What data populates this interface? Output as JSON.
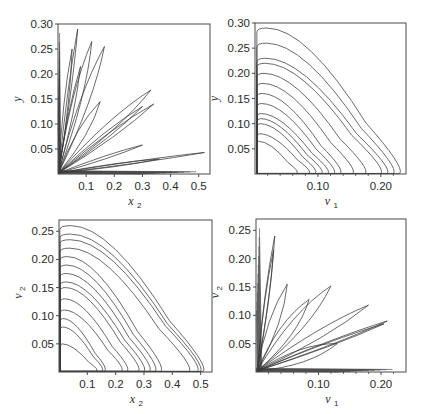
{
  "chart_data": [
    {
      "type": "line",
      "panel": "top-left",
      "title": "",
      "xlabel": "x2",
      "xlabel_main": "x",
      "xlabel_sub": "2",
      "ylabel": "y",
      "ylabel_main": "y",
      "ylabel_sub": "",
      "xlim": [
        0,
        0.54
      ],
      "ylim": [
        0,
        0.3
      ],
      "xticks": [
        0.1,
        0.2,
        0.3,
        0.4,
        0.5
      ],
      "xtick_labels": [
        "0.1",
        "0.2",
        "0.3",
        "0.4",
        "0.5"
      ],
      "yticks": [
        0.05,
        0.1,
        0.15,
        0.2,
        0.25,
        0.3
      ],
      "ytick_labels": [
        "0.05",
        "0.10",
        "0.15",
        "0.20",
        "0.25",
        "0.30"
      ],
      "grid": false,
      "description": "Phase-plane trajectory: many elongated loops radiating from the origin at varying angles",
      "loops": [
        {
          "tip_x": 0.07,
          "tip_y": 0.29,
          "width": 0.01
        },
        {
          "tip_x": 0.12,
          "tip_y": 0.265,
          "width": 0.03
        },
        {
          "tip_x": 0.165,
          "tip_y": 0.255,
          "width": 0.03
        },
        {
          "tip_x": 0.05,
          "tip_y": 0.25,
          "width": 0.015
        },
        {
          "tip_x": 0.08,
          "tip_y": 0.215,
          "width": 0.015
        },
        {
          "tip_x": 0.15,
          "tip_y": 0.145,
          "width": 0.03
        },
        {
          "tip_x": 0.33,
          "tip_y": 0.168,
          "width": 0.03
        },
        {
          "tip_x": 0.34,
          "tip_y": 0.14,
          "width": 0.02
        },
        {
          "tip_x": 0.3,
          "tip_y": 0.135,
          "width": 0.02
        },
        {
          "tip_x": 0.3,
          "tip_y": 0.058,
          "width": 0.01
        },
        {
          "tip_x": 0.52,
          "tip_y": 0.043,
          "width": 0.005
        },
        {
          "tip_x": 0.36,
          "tip_y": 0.03,
          "width": 0.01
        }
      ]
    },
    {
      "type": "line",
      "panel": "top-right",
      "title": "",
      "xlabel": "v1",
      "xlabel_main": "v",
      "xlabel_sub": "1",
      "ylabel": "y",
      "ylabel_main": "y",
      "ylabel_sub": "",
      "xlim": [
        0,
        0.24
      ],
      "ylim": [
        0,
        0.3
      ],
      "xticks": [
        0.1,
        0.2
      ],
      "xtick_labels": [
        "0.10",
        "0.20"
      ],
      "minor_xticks": [
        0.02,
        0.04,
        0.06,
        0.08,
        0.12,
        0.14,
        0.16,
        0.18,
        0.22
      ],
      "yticks": [
        0.05,
        0.1,
        0.15,
        0.2,
        0.25,
        0.3
      ],
      "ytick_labels": [
        "0.05",
        "0.10",
        "0.15",
        "0.20",
        "0.25",
        "0.30"
      ],
      "grid": false,
      "description": "Nested skewed-triangular orbits starting near v1=0",
      "orbits": [
        {
          "peak_y": 0.29,
          "max_x": 0.235
        },
        {
          "peak_y": 0.26,
          "max_x": 0.225
        },
        {
          "peak_y": 0.23,
          "max_x": 0.215
        },
        {
          "peak_y": 0.22,
          "max_x": 0.205
        },
        {
          "peak_y": 0.2,
          "max_x": 0.18
        },
        {
          "peak_y": 0.18,
          "max_x": 0.16
        },
        {
          "peak_y": 0.16,
          "max_x": 0.14
        },
        {
          "peak_y": 0.14,
          "max_x": 0.13
        },
        {
          "peak_y": 0.12,
          "max_x": 0.12
        },
        {
          "peak_y": 0.11,
          "max_x": 0.11
        },
        {
          "peak_y": 0.1,
          "max_x": 0.1
        },
        {
          "peak_y": 0.08,
          "max_x": 0.09
        },
        {
          "peak_y": 0.065,
          "max_x": 0.07
        }
      ]
    },
    {
      "type": "line",
      "panel": "bottom-left",
      "title": "",
      "xlabel": "x2",
      "xlabel_main": "x",
      "xlabel_sub": "2",
      "ylabel": "v2",
      "ylabel_main": "v",
      "ylabel_sub": "2",
      "xlim": [
        0,
        0.54
      ],
      "ylim": [
        0,
        0.27
      ],
      "xticks": [
        0.1,
        0.2,
        0.3,
        0.4,
        0.5
      ],
      "xtick_labels": [
        "0.1",
        "0.2",
        "0.3",
        "0.4",
        "0.5"
      ],
      "yticks": [
        0.05,
        0.1,
        0.15,
        0.2,
        0.25
      ],
      "ytick_labels": [
        "0.05",
        "0.10",
        "0.15",
        "0.20",
        "0.25"
      ],
      "grid": false,
      "description": "Nested skewed-triangular orbits starting near x2=0",
      "orbits": [
        {
          "peak_y": 0.26,
          "max_x": 0.52
        },
        {
          "peak_y": 0.245,
          "max_x": 0.51
        },
        {
          "peak_y": 0.235,
          "max_x": 0.5
        },
        {
          "peak_y": 0.22,
          "max_x": 0.47
        },
        {
          "peak_y": 0.205,
          "max_x": 0.37
        },
        {
          "peak_y": 0.19,
          "max_x": 0.35
        },
        {
          "peak_y": 0.175,
          "max_x": 0.33
        },
        {
          "peak_y": 0.16,
          "max_x": 0.31
        },
        {
          "peak_y": 0.15,
          "max_x": 0.29
        },
        {
          "peak_y": 0.13,
          "max_x": 0.25
        },
        {
          "peak_y": 0.11,
          "max_x": 0.23
        },
        {
          "peak_y": 0.095,
          "max_x": 0.17
        },
        {
          "peak_y": 0.08,
          "max_x": 0.16
        },
        {
          "peak_y": 0.05,
          "max_x": 0.14
        }
      ]
    },
    {
      "type": "line",
      "panel": "bottom-right",
      "title": "",
      "xlabel": "v1",
      "xlabel_main": "v",
      "xlabel_sub": "1",
      "ylabel": "v2",
      "ylabel_main": "v",
      "ylabel_sub": "2",
      "xlim": [
        0,
        0.24
      ],
      "ylim": [
        0,
        0.27
      ],
      "xticks": [
        0.1,
        0.2
      ],
      "xtick_labels": [
        "0.10",
        "0.20"
      ],
      "minor_xticks": [
        0.02,
        0.04,
        0.06,
        0.08,
        0.12,
        0.14,
        0.16,
        0.18,
        0.22
      ],
      "yticks": [
        0.05,
        0.1,
        0.15,
        0.2,
        0.25
      ],
      "ytick_labels": [
        "0.05",
        "0.10",
        "0.15",
        "0.20",
        "0.25"
      ],
      "grid": false,
      "description": "Elongated loops radiating from the origin at varying angles",
      "loops": [
        {
          "tip_x": 0.03,
          "tip_y": 0.24,
          "width": 0.006
        },
        {
          "tip_x": 0.028,
          "tip_y": 0.215,
          "width": 0.006
        },
        {
          "tip_x": 0.05,
          "tip_y": 0.155,
          "width": 0.015
        },
        {
          "tip_x": 0.085,
          "tip_y": 0.128,
          "width": 0.02
        },
        {
          "tip_x": 0.12,
          "tip_y": 0.152,
          "width": 0.02
        },
        {
          "tip_x": 0.18,
          "tip_y": 0.118,
          "width": 0.012
        },
        {
          "tip_x": 0.21,
          "tip_y": 0.09,
          "width": 0.006
        },
        {
          "tip_x": 0.205,
          "tip_y": 0.085,
          "width": 0.006
        },
        {
          "tip_x": 0.13,
          "tip_y": 0.05,
          "width": 0.02
        }
      ]
    }
  ],
  "colors": {
    "frame": "#4a4a4a",
    "curve": "#3a3a3a",
    "text": "#2a2a2a"
  }
}
